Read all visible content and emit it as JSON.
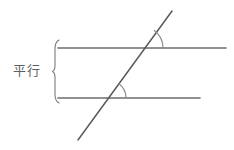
{
  "figure": {
    "background_color": "#ffffff",
    "stroke_color": "#6e6e6e",
    "text_color": "#5f5f5f",
    "width": 234,
    "height": 150
  },
  "labels": {
    "parallel": "平行"
  },
  "brace": {
    "name": "parallel-brace",
    "orientation": "left-facing-vertical",
    "x": 55,
    "y_top": 40,
    "y_bottom": 103
  },
  "lines": [
    {
      "name": "top-parallel-line",
      "x1": 58,
      "y1": 48,
      "x2": 226,
      "y2": 48
    },
    {
      "name": "bottom-parallel-line",
      "x1": 58,
      "y1": 98,
      "x2": 200,
      "y2": 98
    },
    {
      "name": "transversal-line",
      "x1": 78,
      "y1": 140,
      "x2": 172,
      "y2": 11
    }
  ],
  "intersections": [
    {
      "name": "upper-intersection",
      "x": 141,
      "y": 48
    },
    {
      "name": "lower-intersection",
      "x": 108,
      "y": 98
    }
  ],
  "angle_arcs": [
    {
      "name": "upper-angle-arc",
      "vertex_x": 141,
      "vertex_y": 48,
      "radius": 22
    },
    {
      "name": "lower-angle-arc",
      "vertex_x": 108,
      "vertex_y": 98,
      "radius": 18
    }
  ]
}
